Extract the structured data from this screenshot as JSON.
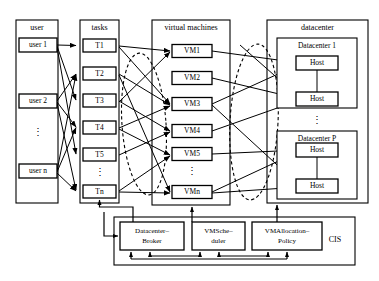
{
  "figure": {
    "columns": [
      {
        "id": "user",
        "title": "user"
      },
      {
        "id": "tasks",
        "title": "tasks"
      },
      {
        "id": "vms",
        "title": "virtual machines"
      },
      {
        "id": "datacenter",
        "title": "datacenter"
      }
    ]
  },
  "users": {
    "header": "user",
    "items": [
      {
        "label": "user 1"
      },
      {
        "label": "user 2"
      },
      {
        "label": "user n"
      }
    ],
    "ellipsis": "⋮"
  },
  "tasks": {
    "header": "tasks",
    "items": [
      {
        "label": "T1"
      },
      {
        "label": "T2"
      },
      {
        "label": "T3"
      },
      {
        "label": "T4"
      },
      {
        "label": "T5"
      },
      {
        "label": "Tn"
      }
    ],
    "ellipsis": "⋮"
  },
  "vms": {
    "header": "virtual machines",
    "items": [
      {
        "label": "VM1"
      },
      {
        "label": "VM2"
      },
      {
        "label": "VM3"
      },
      {
        "label": "VM4"
      },
      {
        "label": "VM5"
      },
      {
        "label": "VMn"
      }
    ],
    "ellipsis": "⋮"
  },
  "datacenter": {
    "header": "datacenter",
    "ellipsis": "⋮",
    "groups": [
      {
        "label": "Datacenter 1",
        "hosts": [
          {
            "label": "Host"
          },
          {
            "label": "Host"
          }
        ]
      },
      {
        "label": "Datacenter P",
        "hosts": [
          {
            "label": "Host"
          },
          {
            "label": "Host"
          }
        ]
      }
    ]
  },
  "cis": {
    "label": "CIS",
    "components": [
      {
        "line1": "Datacenter–",
        "line2": "Broker"
      },
      {
        "line1": "VMSche–",
        "line2": "duler"
      },
      {
        "line1": "VMAllocation–",
        "line2": "Policy"
      }
    ]
  },
  "colors": {
    "stroke": "#000000",
    "background": "#ffffff"
  }
}
